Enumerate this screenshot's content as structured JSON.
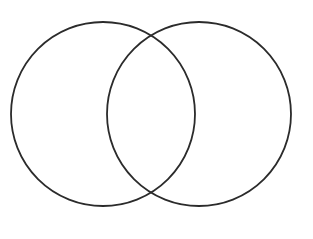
{
  "figure": {
    "kind": "venn-diagram",
    "title": "",
    "background_color": "#ffffff",
    "width": 313,
    "height": 239
  },
  "chart_data": {
    "type": "diagram",
    "subtype": "venn",
    "title": "",
    "xlabel": "",
    "ylabel": "",
    "set_count": 2,
    "filled": false,
    "labelled": false,
    "stroke_color": "#2b2b2b",
    "stroke_width": 1.8,
    "fill_color": "none",
    "sets": [
      {
        "name": "left-set",
        "label": "",
        "cx": 103,
        "cy": 114,
        "r": 92,
        "fill": "none",
        "stroke": "#2b2b2b"
      },
      {
        "name": "right-set",
        "label": "",
        "cx": 199,
        "cy": 114,
        "r": 92,
        "fill": "none",
        "stroke": "#2b2b2b"
      }
    ],
    "intersections": [
      {
        "name": "upper-crossing",
        "x": 152,
        "y": 28
      },
      {
        "name": "lower-crossing",
        "x": 152,
        "y": 200
      }
    ],
    "regions": [
      {
        "name": "left-only",
        "label": "",
        "cx": 66,
        "cy": 114
      },
      {
        "name": "intersection",
        "label": "",
        "cx": 151,
        "cy": 114
      },
      {
        "name": "right-only",
        "label": "",
        "cx": 236,
        "cy": 114
      }
    ]
  }
}
